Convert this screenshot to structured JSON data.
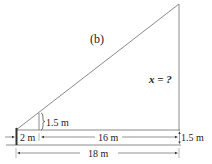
{
  "figure": {
    "panel_label": "(b)",
    "unknown_label": "x = ?",
    "stick_height_label": "1.5 m",
    "eye_height_label": "1.5 m",
    "dist_person_stick_label": "2 m",
    "dist_stick_tree_label": "16 m",
    "total_distance_label": "18 m"
  },
  "colors": {
    "line": "#8a8a8a",
    "text": "#222222"
  }
}
